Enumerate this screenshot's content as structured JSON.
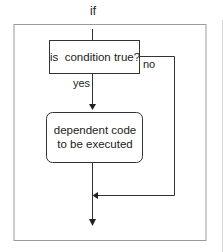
{
  "diagram": {
    "title": "if",
    "nodes": {
      "decision": {
        "label": "is  condition true?",
        "shape": "rectangle"
      },
      "action": {
        "line1": "dependent code",
        "line2": "to be executed",
        "shape": "rounded-rectangle"
      }
    },
    "edges": {
      "yes_label": "yes",
      "no_label": "no"
    },
    "colors": {
      "line": "#333333",
      "frame": "#999999",
      "background": "#ffffff"
    }
  }
}
